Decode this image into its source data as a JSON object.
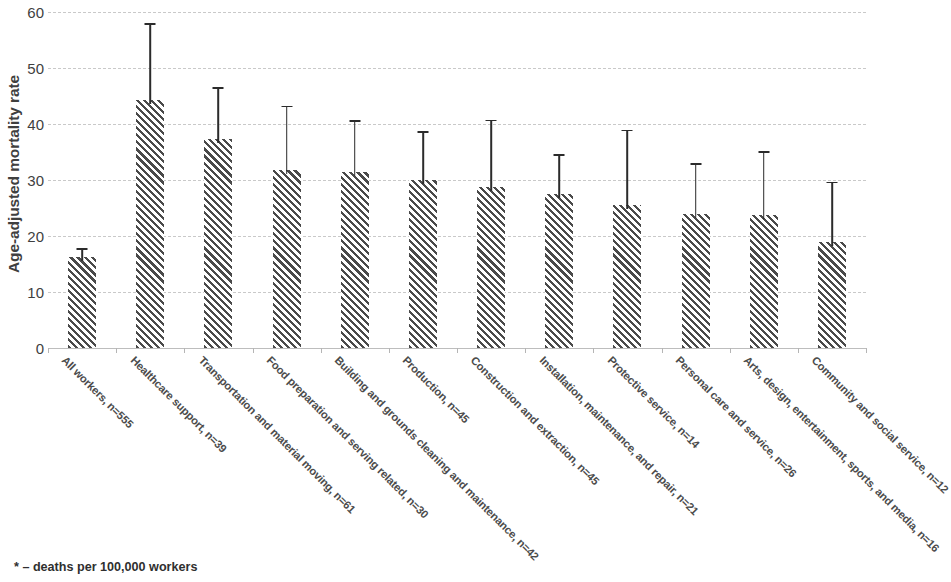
{
  "chart_data": {
    "type": "bar",
    "title": "",
    "subtitle": "",
    "xlabel": "",
    "ylabel": "Age-adjusted mortality rate",
    "ylim": [
      0,
      60
    ],
    "ytick_step": 10,
    "yticks": [
      "60",
      "50",
      "40",
      "30",
      "20",
      "10",
      "0"
    ],
    "grid": "horizontal dashed gridlines",
    "legend": "none",
    "error_bars": "upper 95% confidence limit shown",
    "bar_fill": "diagonal hatch pattern",
    "categories": [
      "All workers, n=555",
      "Healthcare support, n=39",
      "Transportation and material moving, n=61",
      "Food preparation and serving related, n=30",
      "Building and grounds cleaning and maintenance, n=42",
      "Production, n=45",
      "Construction and extraction, n=45",
      "Installation, maintenance, and repair, n=21",
      "Protective service, n=14",
      "Personal care and service, n=26",
      "Arts, design, entertainment, sports, and media, n=16",
      "Community and social service, n=12"
    ],
    "values": [
      16.2,
      44.3,
      37.4,
      31.7,
      31.4,
      30.0,
      28.7,
      27.5,
      25.6,
      23.9,
      23.8,
      18.9
    ],
    "error_upper": [
      17.8,
      58.0,
      46.6,
      43.3,
      40.7,
      38.8,
      40.8,
      34.6,
      39.0,
      33.0,
      35.2,
      29.7
    ],
    "annotations": [
      "* – deaths per 100,000 workers"
    ]
  },
  "axis": {
    "y_title": "Age-adjusted mortality rate"
  },
  "footnote": {
    "text": "* – deaths per 100,000 workers"
  }
}
